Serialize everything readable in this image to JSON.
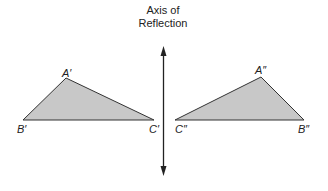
{
  "axis": {
    "title_line1": "Axis of",
    "title_line2": "Reflection"
  },
  "triangles": [
    {
      "name": "first-image",
      "vertices": {
        "A": "A′",
        "B": "B′",
        "C": "C′"
      }
    },
    {
      "name": "second-image",
      "vertices": {
        "A": "A″",
        "B": "B″",
        "C": "C″"
      }
    }
  ],
  "colors": {
    "fill": "#c8c8c8",
    "stroke": "#333333",
    "axis": "#222222"
  }
}
